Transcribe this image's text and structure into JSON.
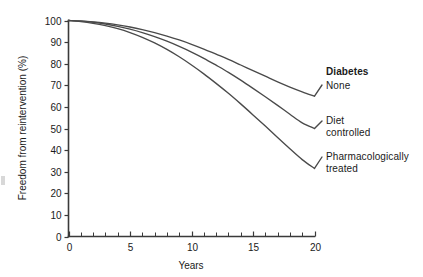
{
  "chart_data": {
    "type": "line",
    "title": "",
    "subtitle": "",
    "xlabel": "Years",
    "ylabel": "Freedom from reintervention (%)",
    "xlim": [
      0,
      20
    ],
    "ylim": [
      0,
      100
    ],
    "grid": false,
    "legend_position": "right-inline-labels",
    "legend_header": "Diabetes",
    "x_ticks_major": [
      0,
      5,
      10,
      15,
      20
    ],
    "x_tick_labels": [
      "0",
      "5",
      "10",
      "15",
      "20"
    ],
    "x_ticks_minor_step": 1,
    "y_ticks": [
      0,
      10,
      20,
      30,
      40,
      50,
      60,
      70,
      80,
      90,
      100
    ],
    "y_tick_labels": [
      "0",
      "10",
      "20",
      "30",
      "40",
      "50",
      "60",
      "70",
      "80",
      "90",
      "100"
    ],
    "x": [
      0,
      1,
      2,
      3,
      4,
      5,
      6,
      7,
      8,
      9,
      10,
      11,
      12,
      13,
      14,
      15,
      16,
      17,
      18,
      19,
      20
    ],
    "series": [
      {
        "name": "None",
        "label": "None",
        "color": "#4a4a4a",
        "values": [
          100,
          99.8,
          99.4,
          98.8,
          98.0,
          97.0,
          95.8,
          94.4,
          92.8,
          91.0,
          89.0,
          86.8,
          84.4,
          82.0,
          79.4,
          76.8,
          74.2,
          71.6,
          69.2,
          67.0,
          65.0
        ]
      },
      {
        "name": "Diet controlled",
        "label": "Diet\ncontrolled",
        "color": "#4a4a4a",
        "values": [
          100,
          99.7,
          99.2,
          98.4,
          97.3,
          96.0,
          94.4,
          92.5,
          90.4,
          88.0,
          85.4,
          82.5,
          79.3,
          76.0,
          72.4,
          68.6,
          64.7,
          60.7,
          56.6,
          52.6,
          50.0
        ]
      },
      {
        "name": "Pharmacologically treated",
        "label": "Pharmacologically\ntreated",
        "color": "#4a4a4a",
        "values": [
          100,
          99.5,
          98.7,
          97.6,
          96.2,
          94.4,
          92.2,
          89.6,
          86.6,
          83.2,
          79.4,
          75.3,
          70.9,
          66.3,
          61.4,
          56.3,
          51.1,
          45.8,
          40.6,
          35.6,
          31.5
        ]
      }
    ],
    "annotations": [
      {
        "text": "Diabetes",
        "bold": true
      },
      {
        "text": "None",
        "bold": false
      },
      {
        "text": "Diet controlled",
        "bold": false
      },
      {
        "text": "Pharmacologically treated",
        "bold": false
      }
    ]
  },
  "labels": {
    "diabetes_header": "Diabetes",
    "none": "None",
    "diet_controlled": "Diet\ncontrolled",
    "pharmacologically_treated": "Pharmacologically\ntreated"
  },
  "colors": {
    "curve": "#4a4a4a",
    "axis": "#3a3a3a",
    "text": "#1a1a1a",
    "background": "#ffffff"
  }
}
